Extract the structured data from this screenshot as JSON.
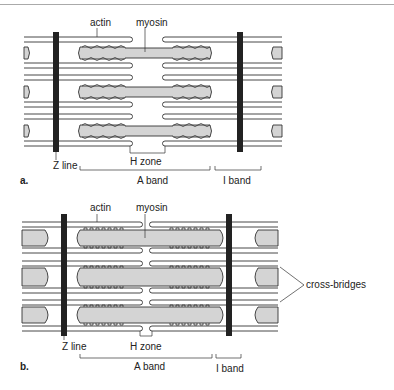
{
  "figure": {
    "colors": {
      "filament_stroke": "#333333",
      "myosin_fill": "#d4d4d4",
      "z_line": "#222222",
      "label": "#222222"
    }
  },
  "panels": [
    {
      "id": "a",
      "label": "a.",
      "labels": {
        "actin": "actin",
        "myosin": "myosin",
        "z_line": "Z line",
        "h_zone": "H zone",
        "a_band": "A band",
        "i_band": "I band"
      }
    },
    {
      "id": "b",
      "label": "b.",
      "labels": {
        "actin": "actin",
        "myosin": "myosin",
        "z_line": "Z line",
        "h_zone": "H zone",
        "a_band": "A band",
        "i_band": "I band",
        "cross_bridges": "cross-bridges"
      }
    }
  ]
}
